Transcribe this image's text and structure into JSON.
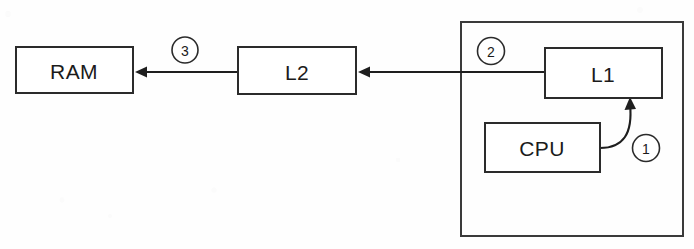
{
  "diagram": {
    "type": "block-diagram",
    "canvas": {
      "width": 694,
      "height": 249
    },
    "colors": {
      "background": "#fefefe",
      "stroke": "#2b2b2b",
      "arrow": "#1e1e1e",
      "text": "#1b1b1b",
      "box_fill": "#ffffff"
    },
    "nodes": [
      {
        "id": "ram",
        "label": "RAM",
        "x": 16,
        "y": 47,
        "width": 117,
        "height": 46,
        "label_cx": 74,
        "label_cy": 71
      },
      {
        "id": "l2",
        "label": "L2",
        "x": 238,
        "y": 47,
        "width": 118,
        "height": 47,
        "label_cx": 297,
        "label_cy": 72
      },
      {
        "id": "l1",
        "label": "L1",
        "x": 545,
        "y": 48,
        "width": 117,
        "height": 50,
        "label_cx": 603,
        "label_cy": 74
      },
      {
        "id": "cpu",
        "label": "CPU",
        "x": 485,
        "y": 123,
        "width": 115,
        "height": 49,
        "label_cx": 542,
        "label_cy": 148
      }
    ],
    "package": {
      "id": "cpu-package",
      "label": "",
      "x": 461,
      "y": 22,
      "width": 222,
      "height": 214
    },
    "edges": [
      {
        "id": "l2-to-ram",
        "from": "l2",
        "to": "ram",
        "step": "3",
        "shape": "straight",
        "x1": 238,
        "y1": 72,
        "x2": 135,
        "y2": 72,
        "arrow_at": "end"
      },
      {
        "id": "l1-to-l2",
        "from": "l1",
        "to": "l2",
        "step": "2",
        "shape": "straight",
        "x1": 545,
        "y1": 72,
        "x2": 358,
        "y2": 72,
        "arrow_at": "end"
      },
      {
        "id": "cpu-to-l1",
        "from": "cpu",
        "to": "l1",
        "step": "1",
        "shape": "curved",
        "path": "M 600 148 C 623 148 633 134 630 104",
        "arrow_at": "end"
      }
    ],
    "step_markers": [
      {
        "id": "step-3",
        "label": "3",
        "cx": 185,
        "cy": 50,
        "r": 13
      },
      {
        "id": "step-2",
        "label": "2",
        "cx": 491,
        "cy": 51,
        "r": 13.5
      },
      {
        "id": "step-1",
        "label": "1",
        "cx": 646,
        "cy": 148,
        "r": 13.5
      }
    ]
  }
}
